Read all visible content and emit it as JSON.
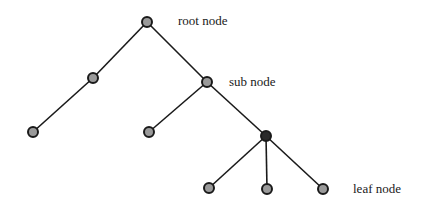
{
  "diagram": {
    "type": "tree",
    "labels": {
      "root": "root node",
      "sub": "sub node",
      "leaf": "leaf node"
    },
    "colors": {
      "edge": "#1a1a1a",
      "node_fill": "#9a9a9a",
      "node_stroke": "#1a1a1a",
      "background": "#ffffff"
    },
    "nodes": [
      {
        "id": "root",
        "x": 147,
        "y": 22
      },
      {
        "id": "left-sub",
        "x": 93,
        "y": 78
      },
      {
        "id": "sub",
        "x": 207,
        "y": 82
      },
      {
        "id": "left-leaf",
        "x": 33,
        "y": 132
      },
      {
        "id": "mid-leaf",
        "x": 149,
        "y": 132
      },
      {
        "id": "inner",
        "x": 266,
        "y": 136
      },
      {
        "id": "leaf-1",
        "x": 209,
        "y": 188
      },
      {
        "id": "leaf-2",
        "x": 267,
        "y": 189
      },
      {
        "id": "leaf-3",
        "x": 323,
        "y": 189
      }
    ],
    "edges": [
      [
        "root",
        "left-sub"
      ],
      [
        "root",
        "sub"
      ],
      [
        "left-sub",
        "left-leaf"
      ],
      [
        "sub",
        "mid-leaf"
      ],
      [
        "sub",
        "inner"
      ],
      [
        "inner",
        "leaf-1"
      ],
      [
        "inner",
        "leaf-2"
      ],
      [
        "inner",
        "leaf-3"
      ]
    ]
  }
}
